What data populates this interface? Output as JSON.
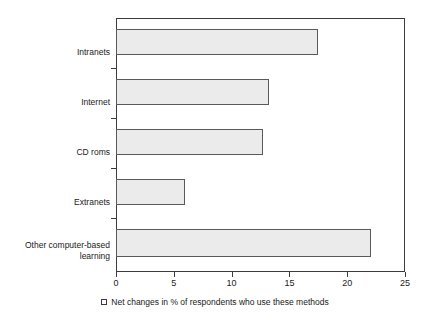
{
  "chart_data": {
    "type": "bar",
    "orientation": "horizontal",
    "title": "",
    "xlabel": "",
    "ylabel": "",
    "categories": [
      "Intranets",
      "Internet",
      "CD roms",
      "Extranets",
      "Other computer-based\nlearning"
    ],
    "values": [
      17.5,
      13.2,
      12.7,
      6.0,
      22.1
    ],
    "xlim": [
      0,
      25
    ],
    "xticks": [
      0,
      5,
      10,
      15,
      20,
      25
    ],
    "xtick_labels": [
      "0",
      "5",
      "10",
      "15",
      "20",
      "25"
    ],
    "grid": false,
    "legend": {
      "position": "bottom",
      "entries": [
        {
          "marker": "open-square-swatch",
          "label": "Net changes in % of respondents who use these methods"
        }
      ]
    },
    "colors": {
      "bar_fill": "#ebebeb",
      "bar_border": "#5a5a5a",
      "axis": "#3c3c3c",
      "text": "#1a1a1a",
      "background": "#ffffff"
    }
  }
}
